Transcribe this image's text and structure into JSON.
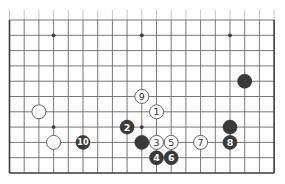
{
  "diagram": {
    "type": "go-board-fragment",
    "board_size": 19,
    "visible_rows": 11,
    "edges_shown": [
      "left",
      "right",
      "bottom"
    ],
    "colors": {
      "background": "#ffffff",
      "line": "#6a6a6a",
      "black_stone": "#3a3a3a",
      "white_stone": "#ffffff"
    },
    "star_points": [
      {
        "col": 3,
        "row": 1
      },
      {
        "col": 9,
        "row": 1
      },
      {
        "col": 15,
        "row": 1
      },
      {
        "col": 3,
        "row": 7
      },
      {
        "col": 9,
        "row": 7
      }
    ],
    "stones": [
      {
        "color": "white",
        "col": 2,
        "row": 6,
        "label": ""
      },
      {
        "color": "white",
        "col": 3,
        "row": 8,
        "label": ""
      },
      {
        "color": "black",
        "col": 9,
        "row": 8,
        "label": ""
      },
      {
        "color": "black",
        "col": 15,
        "row": 7,
        "label": ""
      },
      {
        "color": "black",
        "col": 16,
        "row": 4,
        "label": ""
      },
      {
        "color": "white",
        "col": 10,
        "row": 6,
        "label": "1"
      },
      {
        "color": "black",
        "col": 8,
        "row": 7,
        "label": "2"
      },
      {
        "color": "white",
        "col": 10,
        "row": 8,
        "label": "3"
      },
      {
        "color": "black",
        "col": 10,
        "row": 9,
        "label": "4"
      },
      {
        "color": "white",
        "col": 11,
        "row": 8,
        "label": "5"
      },
      {
        "color": "black",
        "col": 11,
        "row": 9,
        "label": "6"
      },
      {
        "color": "white",
        "col": 13,
        "row": 8,
        "label": "7"
      },
      {
        "color": "black",
        "col": 15,
        "row": 8,
        "label": "8"
      },
      {
        "color": "white",
        "col": 9,
        "row": 5,
        "label": "9"
      },
      {
        "color": "black",
        "col": 5,
        "row": 8,
        "label": "10"
      }
    ]
  }
}
